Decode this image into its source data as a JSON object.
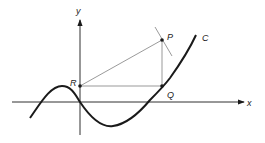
{
  "diagram": {
    "axes": {
      "x_label": "x",
      "y_label": "y"
    },
    "points": {
      "P": {
        "label": "P"
      },
      "Q": {
        "label": "Q"
      },
      "R": {
        "label": "R"
      }
    },
    "curve": {
      "label": "C"
    },
    "colors": {
      "ink": "#1a1a1a",
      "thin": "#555555"
    }
  }
}
